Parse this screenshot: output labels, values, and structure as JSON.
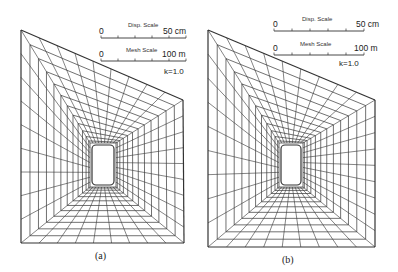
{
  "figure": {
    "panels": [
      {
        "id": "a",
        "caption": "(a)",
        "disp_scale": {
          "label": "Disp. Scale",
          "min": "0",
          "max": "50 cm"
        },
        "mesh_scale": {
          "label": "Mesh Scale",
          "min": "0",
          "max": "100 m"
        },
        "k_label": "k=1.0",
        "outline": {
          "top_left": [
            21,
            30
          ],
          "top_right": [
            183,
            100
          ],
          "bottom_right": [
            184,
            243
          ],
          "bottom_left": [
            21,
            243
          ]
        },
        "opening": {
          "cx": 103,
          "cy": 165,
          "w": 26,
          "h": 44
        }
      },
      {
        "id": "b",
        "caption": "(b)",
        "disp_scale": {
          "label": "Disp. Scale",
          "min": "0",
          "max": "50 cm"
        },
        "mesh_scale": {
          "label": "Mesh Scale",
          "min": "0",
          "max": "100 m"
        },
        "k_label": "k=1.0",
        "outline": {
          "top_left": [
            208,
            30
          ],
          "top_right": [
            375,
            100
          ],
          "bottom_right": [
            375,
            247
          ],
          "bottom_left": [
            208,
            247
          ]
        },
        "opening": {
          "cx": 291,
          "cy": 165,
          "w": 24,
          "h": 44
        }
      }
    ],
    "line_color": "#333333"
  }
}
